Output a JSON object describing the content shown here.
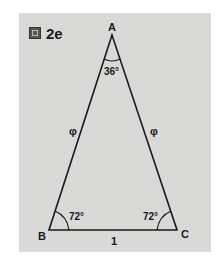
{
  "figure": {
    "label": "2e",
    "icon": "figure-icon"
  },
  "triangle": {
    "vertices": {
      "A": "A",
      "B": "B",
      "C": "C"
    },
    "angles": {
      "A": "36°",
      "B": "72°",
      "C": "72°"
    },
    "sides": {
      "AB": "φ",
      "AC": "φ",
      "BC": "1"
    }
  },
  "colors": {
    "background": "#d9d9d7",
    "stroke": "#1a1a1a"
  }
}
